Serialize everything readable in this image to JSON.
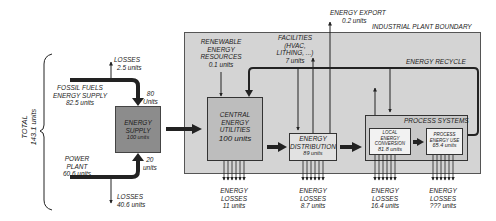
{
  "diagram": {
    "boundary_label": "INDUSTRIAL PLANT BOUNDARY",
    "total": {
      "label": "TOTAL",
      "value": "143.1 units"
    },
    "inputs": {
      "fossil_fuels": {
        "line1": "FOSSIL FUELS",
        "line2": "ENERGY SUPPLY",
        "value": "82.5 units"
      },
      "fossil_losses": {
        "label": "LOSSES",
        "value": "2.5 units"
      },
      "fossil_delivered": {
        "line1": "80",
        "line2": "Units"
      },
      "power_plant": {
        "line1": "POWER",
        "line2": "PLANT",
        "value": "60.6 units"
      },
      "power_losses": {
        "label": "LOSSES",
        "value": "40.6 units"
      },
      "power_delivered": {
        "line1": "20",
        "line2": "units"
      }
    },
    "nodes": {
      "energy_supply": {
        "line1": "ENERGY",
        "line2": "SUPPLY",
        "value": "100 units"
      },
      "central_utilities": {
        "line1": "CENTRAL",
        "line2": "ENERGY",
        "line3": "UTILITIES",
        "value": "100 units"
      },
      "distribution": {
        "line1": "ENERGY",
        "line2": "DISTRIBUTION",
        "value": "89 units"
      },
      "process_systems": {
        "label": "PROCESS SYSTEMS"
      },
      "local_conversion": {
        "line1": "LOCAL",
        "line2": "ENERGY",
        "line3": "CONVERSION",
        "value": "81.8 units"
      },
      "process_use": {
        "line1": "PROCESS",
        "line2": "ENERGY USE",
        "value": "65.4 units"
      }
    },
    "flows": {
      "renewable": {
        "line1": "RENEWABLE",
        "line2": "ENERGY",
        "line3": "RESOURCES",
        "value": "0.1 units"
      },
      "facilities": {
        "line1": "FACILITIES",
        "line2": "(HVAC,",
        "line3": "LITHING, ...)",
        "value": "7 units"
      },
      "export": {
        "label": "ENERGY EXPORT",
        "value": "0.2 units"
      },
      "recycle": {
        "label": "ENERGY RECYCLE"
      }
    },
    "losses": [
      {
        "line1": "ENERGY",
        "line2": "LOSSES",
        "value": "11 units"
      },
      {
        "line1": "ENERGY",
        "line2": "LOSSES",
        "value": "8.7 units"
      },
      {
        "line1": "ENERGY",
        "line2": "LOSSES",
        "value": "16.4 units"
      },
      {
        "line1": "ENERGY",
        "line2": "LOSSES",
        "value": "??? units"
      }
    ],
    "colors": {
      "boundary_fill": "#d4d4d4",
      "supply_fill": "#8c8c8c",
      "utilities_fill": "#bdbdbd",
      "distribution_fill": "#e2e2e2",
      "process_fill": "#c8c8c8",
      "inner_fill": "#f2f2f2",
      "stroke": "#222222"
    }
  }
}
